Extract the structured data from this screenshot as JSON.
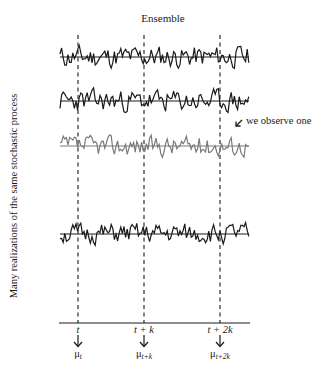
{
  "diagram": {
    "title": "Ensemble",
    "y_axis_label": "Many realizations of the same stochastic process",
    "annotation": "we observe one",
    "colors": {
      "ink": "#1a1a1a",
      "observed_series": "#7a7a7a",
      "background": "#ffffff"
    },
    "series": [
      {
        "name": "realization-1",
        "baseline_y": 57,
        "observed": false,
        "seed": 11,
        "amplitude": 11
      },
      {
        "name": "realization-2",
        "baseline_y": 101,
        "observed": false,
        "seed": 23,
        "amplitude": 11
      },
      {
        "name": "realization-3",
        "baseline_y": 146,
        "observed": true,
        "seed": 37,
        "amplitude": 10
      },
      {
        "name": "realization-4",
        "baseline_y": 234,
        "observed": false,
        "seed": 51,
        "amplitude": 10
      }
    ],
    "series_x_range": [
      60,
      249
    ],
    "time_markers": [
      {
        "x": 78,
        "label": "t",
        "mean_label": "μ",
        "mean_sub": "t"
      },
      {
        "x": 144,
        "label": "t + k",
        "mean_label": "μ",
        "mean_sub": "t+k"
      },
      {
        "x": 220,
        "label": "t + 2k",
        "mean_label": "μ",
        "mean_sub": "t+2k"
      }
    ],
    "time_axis": {
      "y": 323,
      "x_start": 59,
      "x_end": 250
    }
  }
}
